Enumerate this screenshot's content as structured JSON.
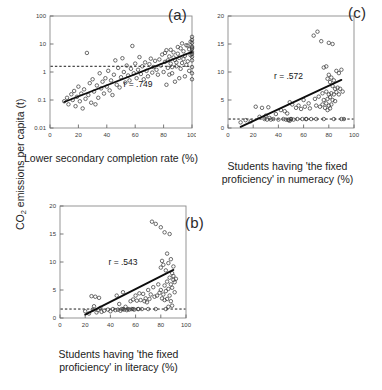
{
  "figure": {
    "y_axis_label_prefix": "CO",
    "y_axis_label_sub": "2",
    "y_axis_label_suffix": " emissions per capita (t)"
  },
  "panels": [
    {
      "tag": "(a)",
      "name": "panel-a",
      "r_text": "r = .749",
      "xlabel_line1": "Lower secondary completion rate (%)",
      "xlabel_line2": ""
    },
    {
      "tag": "(b)",
      "name": "panel-b",
      "r_text": "r = .543",
      "xlabel_line1": "Students having 'the fixed",
      "xlabel_line2": "proficiency' in literacy (%)"
    },
    {
      "tag": "(c)",
      "name": "panel-c",
      "r_text": "r = .572",
      "xlabel_line1": "Students having 'the fixed",
      "xlabel_line2": "proficiency' in numeracy (%)"
    }
  ],
  "chart_data": [
    {
      "type": "scatter",
      "panel": "(a)",
      "title": "",
      "xlabel": "Lower secondary completion rate (%)",
      "ylabel": "CO2 emissions per capita (t)",
      "xlim": [
        0,
        100
      ],
      "ylim": [
        0.01,
        100
      ],
      "yscale": "log",
      "xticks": [
        0,
        20,
        40,
        60,
        80,
        100
      ],
      "yticks": [
        0.01,
        0.1,
        1,
        10,
        100
      ],
      "ytick_labels": [
        "0.01",
        "0.1",
        "1",
        "10",
        "100"
      ],
      "grid": false,
      "legend": "none",
      "annotations": [
        {
          "text": "r = .749",
          "x": 62,
          "y": 0.3
        }
      ],
      "correlation_r": 0.749,
      "reference_line": {
        "type": "horizontal-dashed",
        "y": 1.6,
        "label": ""
      },
      "trend_line": {
        "type": "linear-on-log-y",
        "x0": 10,
        "y0": 0.085,
        "x1": 100,
        "y1": 5.2
      },
      "points": [
        [
          10,
          0.09
        ],
        [
          12,
          0.12
        ],
        [
          13,
          0.07
        ],
        [
          15,
          0.16
        ],
        [
          16,
          0.1
        ],
        [
          17,
          0.21
        ],
        [
          18,
          0.06
        ],
        [
          19,
          0.13
        ],
        [
          20,
          0.3
        ],
        [
          21,
          0.09
        ],
        [
          22,
          0.17
        ],
        [
          23,
          0.05
        ],
        [
          24,
          0.24
        ],
        [
          25,
          0.11
        ],
        [
          26,
          4.8
        ],
        [
          27,
          0.15
        ],
        [
          28,
          0.4
        ],
        [
          29,
          0.08
        ],
        [
          30,
          0.55
        ],
        [
          31,
          0.2
        ],
        [
          32,
          0.07
        ],
        [
          33,
          0.33
        ],
        [
          34,
          0.12
        ],
        [
          35,
          0.9
        ],
        [
          36,
          0.26
        ],
        [
          37,
          0.45
        ],
        [
          38,
          0.17
        ],
        [
          39,
          0.6
        ],
        [
          40,
          0.3
        ],
        [
          41,
          1.1
        ],
        [
          42,
          0.22
        ],
        [
          43,
          0.5
        ],
        [
          44,
          0.15
        ],
        [
          45,
          0.8
        ],
        [
          46,
          2.6
        ],
        [
          47,
          0.35
        ],
        [
          48,
          1.4
        ],
        [
          49,
          0.28
        ],
        [
          50,
          0.65
        ],
        [
          51,
          3.1
        ],
        [
          52,
          1.0
        ],
        [
          53,
          0.42
        ],
        [
          54,
          1.7
        ],
        [
          55,
          0.75
        ],
        [
          56,
          0.5
        ],
        [
          57,
          1.3
        ],
        [
          58,
          8.5
        ],
        [
          59,
          0.9
        ],
        [
          60,
          2.0
        ],
        [
          61,
          0.6
        ],
        [
          62,
          1.2
        ],
        [
          63,
          3.4
        ],
        [
          64,
          0.85
        ],
        [
          65,
          1.6
        ],
        [
          66,
          0.55
        ],
        [
          67,
          2.2
        ],
        [
          68,
          1.1
        ],
        [
          69,
          0.7
        ],
        [
          70,
          1.9
        ],
        [
          71,
          3.0
        ],
        [
          72,
          0.95
        ],
        [
          73,
          1.5
        ],
        [
          74,
          2.5
        ],
        [
          75,
          1.2
        ],
        [
          76,
          0.8
        ],
        [
          77,
          2.8
        ],
        [
          78,
          1.7
        ],
        [
          79,
          4.2
        ],
        [
          80,
          1.0
        ],
        [
          81,
          2.3
        ],
        [
          82,
          6.0
        ],
        [
          83,
          1.4
        ],
        [
          84,
          3.6
        ],
        [
          85,
          2.0
        ],
        [
          86,
          0.9
        ],
        [
          87,
          5.0
        ],
        [
          88,
          2.7
        ],
        [
          89,
          1.6
        ],
        [
          90,
          4.5
        ],
        [
          91,
          3.2
        ],
        [
          92,
          7.0
        ],
        [
          93,
          2.1
        ],
        [
          94,
          5.5
        ],
        [
          95,
          3.8
        ],
        [
          96,
          9.0
        ],
        [
          97,
          2.4
        ],
        [
          98,
          6.5
        ],
        [
          99,
          4.0
        ],
        [
          99,
          12.0
        ],
        [
          100,
          8.0
        ],
        [
          100,
          3.5
        ],
        [
          100,
          18.0
        ],
        [
          100,
          1.5
        ],
        [
          100,
          6.8
        ],
        [
          100,
          0.9
        ],
        [
          100,
          11.0
        ],
        [
          100,
          5.2
        ],
        [
          100,
          2.6
        ],
        [
          100,
          14.0
        ],
        [
          100,
          0.55
        ],
        [
          100,
          7.5
        ],
        [
          100,
          4.4
        ],
        [
          98,
          1.1
        ],
        [
          97,
          8.8
        ],
        [
          96,
          1.8
        ],
        [
          95,
          0.7
        ],
        [
          94,
          2.9
        ],
        [
          93,
          10.5
        ],
        [
          92,
          1.3
        ],
        [
          91,
          0.6
        ],
        [
          90,
          7.8
        ],
        [
          89,
          2.2
        ],
        [
          88,
          0.45
        ],
        [
          87,
          3.3
        ],
        [
          86,
          1.5
        ],
        [
          85,
          6.2
        ],
        [
          84,
          0.8
        ],
        [
          83,
          2.6
        ],
        [
          82,
          0.35
        ],
        [
          81,
          4.8
        ]
      ]
    },
    {
      "type": "scatter",
      "panel": "(b)",
      "title": "",
      "xlabel": "Students having 'the fixed proficiency' in literacy (%)",
      "ylabel": "CO2 emissions per capita (t)",
      "xlim": [
        0,
        100
      ],
      "ylim": [
        0,
        20
      ],
      "yscale": "linear",
      "xticks": [
        0,
        20,
        40,
        60,
        80,
        100
      ],
      "yticks": [
        0,
        5,
        10,
        15,
        20
      ],
      "ytick_labels": [
        "0",
        "5",
        "10",
        "15",
        "20"
      ],
      "grid": false,
      "legend": "none",
      "annotations": [
        {
          "text": "r = .543",
          "x": 50,
          "y": 9.5
        }
      ],
      "correlation_r": 0.543,
      "reference_line": {
        "type": "horizontal-dashed",
        "y": 1.6,
        "label": ""
      },
      "trend_line": {
        "type": "linear",
        "x0": 20,
        "y0": 0.6,
        "x1": 90,
        "y1": 8.6
      },
      "points": [
        [
          20,
          1.2
        ],
        [
          23,
          0.8
        ],
        [
          25,
          3.9
        ],
        [
          26,
          1.5
        ],
        [
          27,
          2.1
        ],
        [
          28,
          3.8
        ],
        [
          29,
          1.0
        ],
        [
          30,
          1.4
        ],
        [
          31,
          3.6
        ],
        [
          32,
          1.8
        ],
        [
          33,
          1.1
        ],
        [
          35,
          1.3
        ],
        [
          38,
          1.5
        ],
        [
          40,
          1.2
        ],
        [
          42,
          1.6
        ],
        [
          44,
          1.4
        ],
        [
          45,
          4.0
        ],
        [
          46,
          1.5
        ],
        [
          47,
          2.5
        ],
        [
          48,
          1.3
        ],
        [
          49,
          1.6
        ],
        [
          50,
          4.6
        ],
        [
          51,
          1.5
        ],
        [
          52,
          2.0
        ],
        [
          53,
          1.4
        ],
        [
          54,
          1.6
        ],
        [
          55,
          1.5
        ],
        [
          56,
          3.0
        ],
        [
          57,
          1.6
        ],
        [
          58,
          3.3
        ],
        [
          59,
          1.5
        ],
        [
          60,
          4.0
        ],
        [
          61,
          3.1
        ],
        [
          62,
          1.6
        ],
        [
          63,
          4.4
        ],
        [
          64,
          3.2
        ],
        [
          65,
          1.6
        ],
        [
          66,
          4.3
        ],
        [
          67,
          3.0
        ],
        [
          68,
          3.5
        ],
        [
          69,
          2.8
        ],
        [
          70,
          5.0
        ],
        [
          71,
          3.4
        ],
        [
          72,
          4.2
        ],
        [
          73,
          17.2
        ],
        [
          74,
          5.5
        ],
        [
          75,
          3.8
        ],
        [
          76,
          16.8
        ],
        [
          77,
          4.0
        ],
        [
          78,
          6.0
        ],
        [
          79,
          4.5
        ],
        [
          80,
          16.2
        ],
        [
          80,
          9.0
        ],
        [
          80,
          5.0
        ],
        [
          81,
          10.2
        ],
        [
          81,
          3.5
        ],
        [
          82,
          9.5
        ],
        [
          82,
          4.2
        ],
        [
          83,
          15.3
        ],
        [
          83,
          5.8
        ],
        [
          83,
          3.2
        ],
        [
          84,
          8.5
        ],
        [
          84,
          4.8
        ],
        [
          85,
          11.5
        ],
        [
          85,
          6.5
        ],
        [
          85,
          3.4
        ],
        [
          86,
          9.8
        ],
        [
          86,
          5.2
        ],
        [
          86,
          2.0
        ],
        [
          87,
          15.0
        ],
        [
          87,
          7.2
        ],
        [
          87,
          4.0
        ],
        [
          88,
          10.5
        ],
        [
          88,
          6.0
        ],
        [
          88,
          3.0
        ],
        [
          89,
          8.0
        ],
        [
          89,
          5.4
        ],
        [
          89,
          2.2
        ],
        [
          90,
          7.5
        ],
        [
          90,
          6.8
        ],
        [
          90,
          9.2
        ],
        [
          91,
          6.4
        ],
        [
          91,
          4.6
        ],
        [
          92,
          7.0
        ],
        [
          50,
          1.6
        ],
        [
          58,
          1.6
        ],
        [
          62,
          1.6
        ],
        [
          70,
          1.6
        ],
        [
          76,
          1.6
        ],
        [
          84,
          1.6
        ]
      ]
    },
    {
      "type": "scatter",
      "panel": "(c)",
      "title": "",
      "xlabel": "Students having 'the fixed proficiency' in numeracy (%)",
      "ylabel": "CO2 emissions per capita (t)",
      "xlim": [
        0,
        100
      ],
      "ylim": [
        0,
        20
      ],
      "yscale": "linear",
      "xticks": [
        0,
        20,
        40,
        60,
        80,
        100
      ],
      "yticks": [
        0,
        5,
        10,
        15,
        20
      ],
      "ytick_labels": [
        "0",
        "5",
        "10",
        "15",
        "20"
      ],
      "grid": false,
      "legend": "none",
      "annotations": [
        {
          "text": "r = .572",
          "x": 48,
          "y": 8.8
        }
      ],
      "correlation_r": 0.572,
      "reference_line": {
        "type": "horizontal-dashed",
        "y": 1.6,
        "label": ""
      },
      "trend_line": {
        "type": "linear",
        "x0": 10,
        "y0": 0.2,
        "x1": 90,
        "y1": 8.6
      },
      "points": [
        [
          10,
          1.0
        ],
        [
          14,
          1.4
        ],
        [
          18,
          1.2
        ],
        [
          22,
          3.8
        ],
        [
          25,
          2.0
        ],
        [
          27,
          3.6
        ],
        [
          29,
          1.6
        ],
        [
          30,
          2.2
        ],
        [
          31,
          1.5
        ],
        [
          32,
          3.7
        ],
        [
          33,
          1.8
        ],
        [
          34,
          1.5
        ],
        [
          36,
          1.6
        ],
        [
          38,
          2.5
        ],
        [
          40,
          1.5
        ],
        [
          42,
          3.2
        ],
        [
          44,
          1.6
        ],
        [
          45,
          3.0
        ],
        [
          46,
          1.5
        ],
        [
          47,
          2.6
        ],
        [
          48,
          1.4
        ],
        [
          49,
          4.6
        ],
        [
          50,
          1.6
        ],
        [
          51,
          4.2
        ],
        [
          52,
          1.5
        ],
        [
          54,
          3.6
        ],
        [
          55,
          1.6
        ],
        [
          56,
          4.0
        ],
        [
          58,
          3.4
        ],
        [
          59,
          1.6
        ],
        [
          60,
          5.0
        ],
        [
          61,
          3.8
        ],
        [
          62,
          1.6
        ],
        [
          64,
          4.4
        ],
        [
          65,
          3.5
        ],
        [
          66,
          1.6
        ],
        [
          68,
          16.5
        ],
        [
          69,
          5.2
        ],
        [
          70,
          4.0
        ],
        [
          71,
          17.2
        ],
        [
          72,
          5.6
        ],
        [
          73,
          3.8
        ],
        [
          74,
          15.5
        ],
        [
          75,
          6.2
        ],
        [
          75,
          4.2
        ],
        [
          76,
          10.8
        ],
        [
          76,
          5.0
        ],
        [
          77,
          3.6
        ],
        [
          78,
          11.0
        ],
        [
          78,
          6.5
        ],
        [
          78,
          4.4
        ],
        [
          79,
          8.8
        ],
        [
          79,
          5.2
        ],
        [
          79,
          3.2
        ],
        [
          80,
          15.2
        ],
        [
          80,
          9.5
        ],
        [
          80,
          6.0
        ],
        [
          80,
          4.0
        ],
        [
          81,
          8.2
        ],
        [
          81,
          5.5
        ],
        [
          81,
          3.5
        ],
        [
          82,
          9.0
        ],
        [
          82,
          6.2
        ],
        [
          82,
          4.2
        ],
        [
          83,
          15.0
        ],
        [
          83,
          7.5
        ],
        [
          83,
          5.0
        ],
        [
          84,
          8.5
        ],
        [
          84,
          6.0
        ],
        [
          85,
          7.0
        ],
        [
          85,
          4.8
        ],
        [
          86,
          10.2
        ],
        [
          86,
          6.4
        ],
        [
          87,
          7.2
        ],
        [
          88,
          9.8
        ],
        [
          88,
          6.0
        ],
        [
          89,
          7.0
        ],
        [
          90,
          10.4
        ],
        [
          91,
          6.5
        ],
        [
          92,
          1.6
        ],
        [
          48,
          1.5
        ],
        [
          49,
          1.3
        ],
        [
          50,
          1.6
        ],
        [
          62,
          1.6
        ],
        [
          70,
          1.6
        ],
        [
          76,
          1.6
        ],
        [
          84,
          1.6
        ],
        [
          90,
          1.6
        ]
      ]
    }
  ]
}
